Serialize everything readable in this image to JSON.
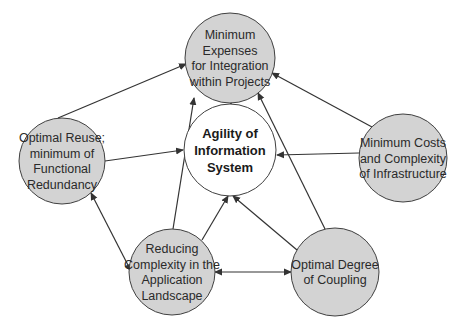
{
  "diagram": {
    "colors": {
      "node_fill": "#d3d3d3",
      "center_fill": "#ffffff",
      "stroke": "#404040",
      "edge": "#333333"
    },
    "nodes": [
      {
        "id": "integration",
        "lines": [
          "Minimum",
          "Expenses",
          "for Integration",
          "within Projects"
        ],
        "cx": 230,
        "cy": 58,
        "r": 45,
        "fill": "#d3d3d3",
        "bold": false
      },
      {
        "id": "agility",
        "lines": [
          "Agility of",
          "Information",
          "System"
        ],
        "cx": 230,
        "cy": 150,
        "r": 46,
        "fill": "#ffffff",
        "bold": true
      },
      {
        "id": "reuse",
        "lines": [
          "Optimal Reuse;",
          "minimum of",
          "Functional",
          "Redundancy"
        ],
        "cx": 62,
        "cy": 161,
        "r": 43,
        "fill": "#d3d3d3",
        "bold": false
      },
      {
        "id": "infrastructure",
        "lines": [
          "Minimum Costs",
          "and Complexity",
          "of Infrastructure"
        ],
        "cx": 403,
        "cy": 158,
        "r": 44,
        "fill": "#d3d3d3",
        "bold": false
      },
      {
        "id": "complexity",
        "lines": [
          "Reducing",
          "Complexity in the",
          "Application",
          "Landscape"
        ],
        "cx": 172,
        "cy": 272,
        "r": 43,
        "fill": "#d3d3d3",
        "bold": false
      },
      {
        "id": "coupling",
        "lines": [
          "Optimal Degree",
          "of Coupling"
        ],
        "cx": 335,
        "cy": 272,
        "r": 44,
        "fill": "#d3d3d3",
        "bold": false
      }
    ],
    "edges": [
      {
        "from": "integration",
        "to": "agility",
        "x1": 230,
        "y1": 103,
        "x2": 230,
        "y2": 102,
        "type": "arrow-end"
      },
      {
        "from": "reuse",
        "to": "integration",
        "x1": 58,
        "y1": 118,
        "x2": 186,
        "y2": 64,
        "type": "arrow-end"
      },
      {
        "from": "infrastructure",
        "to": "integration",
        "x1": 372,
        "y1": 127,
        "x2": 272,
        "y2": 73,
        "type": "arrow-end"
      },
      {
        "from": "reuse",
        "to": "agility",
        "x1": 105,
        "y1": 161,
        "x2": 183,
        "y2": 150,
        "type": "arrow-end"
      },
      {
        "from": "infrastructure",
        "to": "agility",
        "x1": 359,
        "y1": 153,
        "x2": 277,
        "y2": 155,
        "type": "arrow-end"
      },
      {
        "from": "reuse",
        "to": "complexity",
        "x1": 91,
        "y1": 193,
        "x2": 131,
        "y2": 271,
        "type": "arrow-both"
      },
      {
        "from": "complexity",
        "to": "integration",
        "x1": 173,
        "y1": 229,
        "x2": 194,
        "y2": 98,
        "type": "arrow-end"
      },
      {
        "from": "coupling",
        "to": "integration",
        "x1": 325,
        "y1": 229,
        "x2": 258,
        "y2": 93,
        "type": "arrow-end"
      },
      {
        "from": "complexity",
        "to": "agility",
        "x1": 202,
        "y1": 240,
        "x2": 228,
        "y2": 196,
        "type": "arrow-end"
      },
      {
        "from": "coupling",
        "to": "agility",
        "x1": 297,
        "y1": 250,
        "x2": 233,
        "y2": 196,
        "type": "arrow-end"
      },
      {
        "from": "complexity",
        "to": "coupling",
        "x1": 215,
        "y1": 272,
        "x2": 291,
        "y2": 272,
        "type": "arrow-both"
      }
    ]
  }
}
